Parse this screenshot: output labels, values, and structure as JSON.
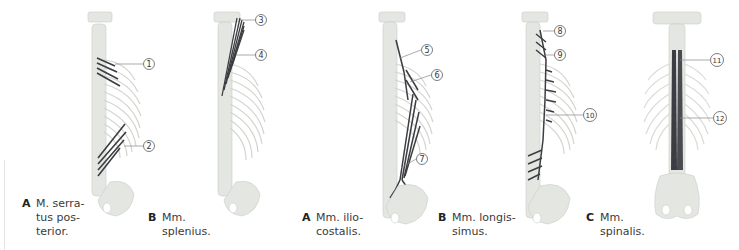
{
  "figure": {
    "colors": {
      "bone": "#e4e6e2",
      "bone_shade": "#c9ccc6",
      "muscle": "#3c3d42",
      "leader_line": "#888888",
      "caption_text": "#3a3a3a"
    },
    "panels": [
      {
        "id": "A1",
        "letter": "A",
        "caption": "M. serra-\ntus pos-\nterior.",
        "callouts": [
          "①",
          "②"
        ]
      },
      {
        "id": "B1",
        "letter": "B",
        "caption": "Mm.\nsplenius.",
        "callouts": [
          "③",
          "④"
        ]
      },
      {
        "id": "A2",
        "letter": "A",
        "caption": "Mm. ilio-\ncostalis.",
        "callouts": [
          "⑤",
          "⑥",
          "⑦"
        ]
      },
      {
        "id": "B2",
        "letter": "B",
        "caption": "Mm. longis-\nsimus.",
        "callouts": [
          "⑧",
          "⑨",
          "⑩"
        ]
      },
      {
        "id": "C",
        "letter": "C",
        "caption": "Mm.\nspinalis.",
        "callouts": [
          "⑪",
          "⑫"
        ]
      }
    ]
  }
}
